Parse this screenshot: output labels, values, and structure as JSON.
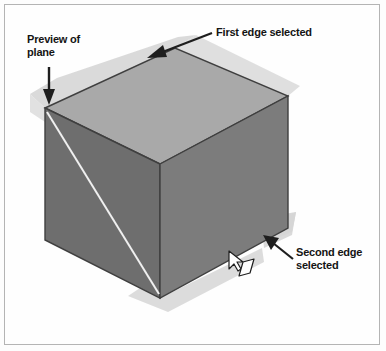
{
  "figure": {
    "background_color": "#fefefe",
    "border_color": "#b4b4b4",
    "annotations": [
      {
        "id": "preview-of-plane",
        "text": "Preview of\nplane",
        "arrow_direction": "down",
        "points_to": "cube top-left corner"
      },
      {
        "id": "first-edge-selected",
        "text": "First edge selected",
        "arrow_direction": "down-left",
        "points_to": "cube top-back-left edge"
      },
      {
        "id": "second-edge-selected",
        "text": "Second edge\nselected",
        "arrow_direction": "up-left",
        "points_to": "cube bottom-right edge"
      }
    ],
    "cube": {
      "top_face_color": "#a9a9a9",
      "left_face_color": "#6e6e6e",
      "right_face_color": "#7b7b7b",
      "edge_color": "#3c3c3c"
    },
    "preview_plane": {
      "fill_color": "#d5d5d5",
      "line_color": "#e8e8e8",
      "label": "preview plane band"
    },
    "cursor": {
      "icon": "mouse-pointer-with-plane-glyph",
      "x": 231,
      "y": 256
    }
  }
}
